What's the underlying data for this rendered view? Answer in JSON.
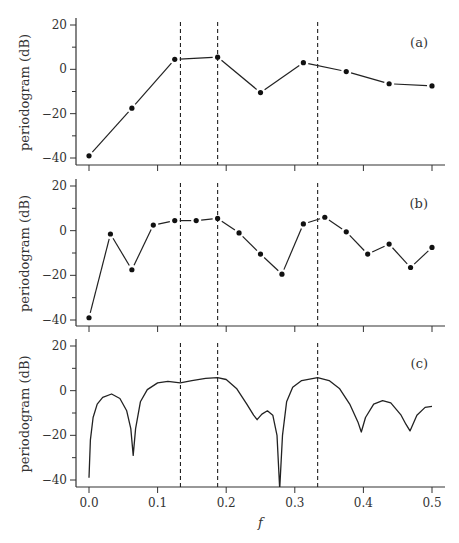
{
  "chart_data": [
    {
      "type": "line",
      "panel_label": "(a)",
      "xlabel": "",
      "ylabel": "periodogram  (dB)",
      "xlim": [
        0,
        0.5
      ],
      "ylim": [
        -42,
        22
      ],
      "yticks": [
        20,
        0,
        -20,
        -40
      ],
      "ytick_labels": [
        "20",
        "0",
        "−20",
        "−40"
      ],
      "xticks": [
        0,
        0.1,
        0.2,
        0.3,
        0.4,
        0.5
      ],
      "markers": true,
      "x": [
        0,
        0.0625,
        0.125,
        0.1875,
        0.25,
        0.3125,
        0.375,
        0.4375,
        0.5
      ],
      "values": [
        -39,
        -17.5,
        4.5,
        5.5,
        -10.5,
        3,
        -1,
        -6.5,
        -7.5
      ],
      "vlines": [
        0.1333,
        0.1875,
        0.3333
      ],
      "grid": false
    },
    {
      "type": "line",
      "panel_label": "(b)",
      "xlabel": "",
      "ylabel": "periodogram  (dB)",
      "xlim": [
        0,
        0.5
      ],
      "ylim": [
        -42,
        22
      ],
      "yticks": [
        20,
        0,
        -20,
        -40
      ],
      "ytick_labels": [
        "20",
        "0",
        "−20",
        "−40"
      ],
      "xticks": [
        0,
        0.1,
        0.2,
        0.3,
        0.4,
        0.5
      ],
      "markers": true,
      "x": [
        0,
        0.03125,
        0.0625,
        0.09375,
        0.125,
        0.15625,
        0.1875,
        0.21875,
        0.25,
        0.28125,
        0.3125,
        0.34375,
        0.375,
        0.40625,
        0.4375,
        0.46875,
        0.5
      ],
      "values": [
        -39,
        -1.5,
        -17.5,
        2.5,
        4.5,
        4.5,
        5.5,
        -1,
        -10.5,
        -19.5,
        3,
        6,
        -0.5,
        -10.5,
        -6,
        -16.5,
        -7.5
      ],
      "vlines": [
        0.1333,
        0.1875,
        0.3333
      ],
      "grid": false
    },
    {
      "type": "line",
      "panel_label": "(c)",
      "xlabel": "f",
      "ylabel": "periodogram  (dB)",
      "xlim": [
        0,
        0.5
      ],
      "ylim": [
        -42,
        22
      ],
      "yticks": [
        20,
        0,
        -20,
        -40
      ],
      "ytick_labels": [
        "20",
        "0",
        "−20",
        "−40"
      ],
      "xticks": [
        0,
        0.1,
        0.2,
        0.3,
        0.4,
        0.5
      ],
      "xtick_labels": [
        "0.0",
        "0.1",
        "0.2",
        "0.3",
        "0.4",
        "0.5"
      ],
      "markers": false,
      "x": [
        0,
        0.002,
        0.006,
        0.012,
        0.02,
        0.033,
        0.045,
        0.055,
        0.061,
        0.0645,
        0.068,
        0.075,
        0.085,
        0.1,
        0.115,
        0.133,
        0.15,
        0.17,
        0.1875,
        0.2,
        0.215,
        0.23,
        0.24,
        0.245,
        0.252,
        0.26,
        0.268,
        0.274,
        0.278,
        0.282,
        0.288,
        0.297,
        0.31,
        0.3333,
        0.35,
        0.365,
        0.38,
        0.392,
        0.397,
        0.403,
        0.415,
        0.428,
        0.44,
        0.455,
        0.462,
        0.468,
        0.478,
        0.49,
        0.5
      ],
      "values": [
        -39,
        -22,
        -12,
        -6,
        -3,
        -1.5,
        -3.5,
        -9,
        -17,
        -29,
        -17,
        -5,
        0.5,
        3.5,
        4.2,
        3.5,
        4.5,
        5.5,
        5.8,
        5,
        1,
        -6,
        -11,
        -13,
        -10.5,
        -9,
        -11,
        -20,
        -44,
        -20,
        -5,
        1.5,
        4.5,
        5.8,
        4.5,
        1,
        -6,
        -14,
        -18.5,
        -12,
        -6,
        -4.5,
        -5.5,
        -11,
        -15,
        -18,
        -11,
        -7.5,
        -7
      ],
      "vlines": [
        0.1333,
        0.1875,
        0.3333
      ],
      "grid": false
    }
  ]
}
